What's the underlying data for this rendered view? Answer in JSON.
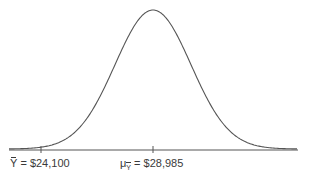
{
  "chart_data": {
    "type": "line",
    "title": "",
    "xlabel": "",
    "ylabel": "",
    "grid": false,
    "legend": null,
    "series": [
      {
        "name": "sampling distribution of Y-bar",
        "shape": "normal",
        "mean": 28985
      }
    ],
    "annotations": [
      {
        "symbol": "Y",
        "symbol_decoration": "bar",
        "text": "= $24,100",
        "value": 24100
      },
      {
        "symbol": "μ",
        "subscript": "Y",
        "subscript_decoration": "bar",
        "text": "= $28,985",
        "value": 28985
      }
    ],
    "ticks": [
      24100,
      28985
    ]
  },
  "colors": {
    "curve": "#555555",
    "axis": "#555555",
    "text": "#3a3a3a",
    "background": "#ffffff"
  }
}
